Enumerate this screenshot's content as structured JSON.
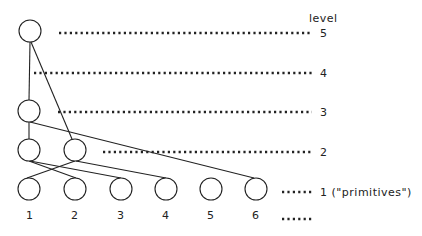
{
  "diagram": {
    "header": "level",
    "levels": [
      {
        "id": "L5",
        "label": "5",
        "y": 33,
        "dots_x1": 59,
        "dots_x2": 312
      },
      {
        "id": "L4",
        "label": "4",
        "y": 73,
        "dots_x1": 34,
        "dots_x2": 312
      },
      {
        "id": "L3",
        "label": "3",
        "y": 112,
        "dots_x1": 58,
        "dots_x2": 312
      },
      {
        "id": "L2",
        "label": "2",
        "y": 152,
        "dots_x1": 103,
        "dots_x2": 312
      },
      {
        "id": "L1",
        "label": "1 (\"primitives\")",
        "y": 191,
        "dots_x1": 282,
        "dots_x2": 313
      },
      {
        "id": "L0",
        "label": "",
        "y": 218,
        "dots_x1": 282,
        "dots_x2": 313
      }
    ],
    "nodes": [
      {
        "id": "n5",
        "level": 5,
        "cx": 30,
        "cy": 31
      },
      {
        "id": "n3",
        "level": 3,
        "cx": 29,
        "cy": 111
      },
      {
        "id": "n2a",
        "level": 2,
        "cx": 29,
        "cy": 150
      },
      {
        "id": "n2b",
        "level": 2,
        "cx": 75,
        "cy": 150
      },
      {
        "id": "p1",
        "level": 1,
        "cx": 29,
        "cy": 189,
        "label": "1"
      },
      {
        "id": "p2",
        "level": 1,
        "cx": 75,
        "cy": 189,
        "label": "2"
      },
      {
        "id": "p3",
        "level": 1,
        "cx": 121,
        "cy": 189,
        "label": "3"
      },
      {
        "id": "p4",
        "level": 1,
        "cx": 166,
        "cy": 189,
        "label": "4"
      },
      {
        "id": "p5",
        "level": 1,
        "cx": 211,
        "cy": 189,
        "label": "5"
      },
      {
        "id": "p6",
        "level": 1,
        "cx": 256,
        "cy": 189,
        "label": "6"
      }
    ],
    "edges": [
      {
        "from": "n5",
        "to": "n3"
      },
      {
        "from": "n5",
        "to": "n2b"
      },
      {
        "from": "n3",
        "to": "n2a"
      },
      {
        "from": "n3",
        "to": "p6"
      },
      {
        "from": "n2a",
        "to": "p2"
      },
      {
        "from": "n2a",
        "to": "p3"
      },
      {
        "from": "n2b",
        "to": "p1"
      },
      {
        "from": "n2b",
        "to": "p4"
      }
    ],
    "primitive_labels": [
      "1",
      "2",
      "3",
      "4",
      "5",
      "6"
    ],
    "level_labels": {
      "l5": "5",
      "l4": "4",
      "l3": "3",
      "l2": "2",
      "l1": "1 (\"primitives\")"
    }
  }
}
